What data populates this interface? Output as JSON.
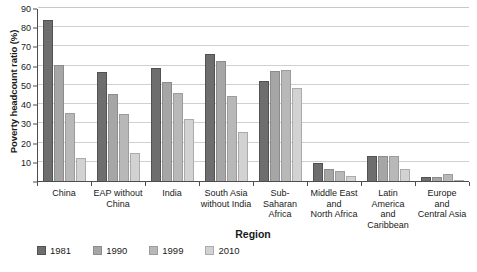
{
  "chart_data": {
    "type": "bar",
    "title": "",
    "subtitle": "",
    "xlabel": "Region",
    "ylabel": "Poverty headcount ratio (%)",
    "ylim": [
      0,
      90
    ],
    "ytick_step": 10,
    "yticks": [
      0,
      10,
      20,
      30,
      40,
      50,
      60,
      70,
      80,
      90
    ],
    "grid": true,
    "legend_position": "bottom-left",
    "categories": [
      "China",
      "EAP without China",
      "India",
      "South Asia without India",
      "Sub-Saharan Africa",
      "Middle East and North Africa",
      "Latin America and Caribbean",
      "Europe and Central Asia"
    ],
    "category_lines": [
      [
        "China"
      ],
      [
        "EAP without",
        "China"
      ],
      [
        "India"
      ],
      [
        "South Asia",
        "without India"
      ],
      [
        "Sub-Saharan",
        "Africa"
      ],
      [
        "Middle East",
        "and",
        "North Africa"
      ],
      [
        "Latin America",
        "and",
        "Caribbean"
      ],
      [
        "Europe",
        "and",
        "Central Asia"
      ]
    ],
    "series": [
      {
        "name": "1981",
        "color": "#6e6e6e",
        "values": [
          84.0,
          56.8,
          58.8,
          66.0,
          51.8,
          9.5,
          13.0,
          2.0
        ]
      },
      {
        "name": "1990",
        "color": "#a6a6a6",
        "values": [
          60.2,
          45.2,
          51.3,
          62.5,
          57.0,
          6.0,
          13.0,
          2.0
        ]
      },
      {
        "name": "1999",
        "color": "#b8b8b8",
        "values": [
          35.6,
          35.0,
          45.8,
          44.0,
          58.0,
          5.0,
          13.0,
          3.8
        ]
      },
      {
        "name": "2010",
        "color": "#d2d2d2",
        "values": [
          11.8,
          14.5,
          32.5,
          25.5,
          48.5,
          2.5,
          6.0,
          0.7
        ]
      }
    ]
  },
  "axis": {
    "y_title": "Poverty headcount ratio (%)",
    "x_title": "Region"
  }
}
